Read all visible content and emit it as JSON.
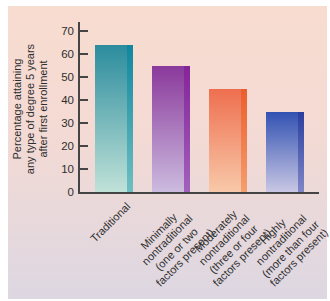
{
  "figure": {
    "border_color": "#ffffff",
    "background_top": "#f8dcd0",
    "background_bottom": "#ddd7e2",
    "axis_color": "#454545",
    "text_color": "#2e2e2e"
  },
  "chart_data": {
    "type": "bar",
    "title": "",
    "xlabel": "",
    "ylabel": "Percentage attaining any type of degree 5 years after first enrollment",
    "ylabel_lines": [
      "Percentage attaining",
      "any type of degree 5 years",
      "after first enrollment"
    ],
    "ylim": [
      0,
      70
    ],
    "yticks": [
      0,
      10,
      20,
      30,
      40,
      50,
      60,
      70
    ],
    "grid": false,
    "legend": false,
    "categories": [
      "Traditional",
      "Minimally nontraditional (one or two factors present)",
      "Moderately nontraditional (three or four factors present)",
      "Highly nontraditional (more than four factors present)"
    ],
    "category_lines": [
      [
        "Traditional"
      ],
      [
        "Minimally",
        "nontraditional",
        "(one or two",
        "factors present)"
      ],
      [
        "Moderately",
        "nontraditional",
        "(three or four",
        "factors present)"
      ],
      [
        "Highly",
        "nontraditional",
        "(more than four",
        "factors present)"
      ]
    ],
    "values": [
      64,
      55,
      45,
      35
    ],
    "bar_styles": [
      {
        "top": "#2b8c9d",
        "bottom": "#c0e2d8",
        "edge_top": "#0f86a0",
        "edge_bottom": "#6fbfc2"
      },
      {
        "top": "#8a399b",
        "bottom": "#ccbbdf",
        "edge_top": "#85249a",
        "edge_bottom": "#a161bb"
      },
      {
        "top": "#ee6f4f",
        "bottom": "#f8c9a9",
        "edge_top": "#eb5d2d",
        "edge_bottom": "#f59e6e"
      },
      {
        "top": "#3252b2",
        "bottom": "#c9c7e4",
        "edge_top": "#2a3ea0",
        "edge_bottom": "#7f86c6"
      }
    ]
  }
}
